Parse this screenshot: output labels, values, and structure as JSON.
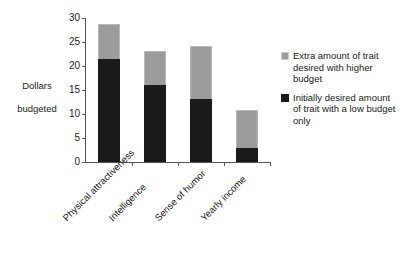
{
  "chart_data": {
    "type": "bar",
    "subtype": "stacked-bar",
    "title": "",
    "xlabel": "",
    "ylabel": "Dollars budgeted",
    "ylim": [
      0,
      30
    ],
    "yticks": [
      0,
      5,
      10,
      15,
      20,
      25,
      30
    ],
    "grid": false,
    "legend_position": "right",
    "categories": [
      "Physical attractiveness",
      "Intelligence",
      "Sense of humor",
      "Yearly income"
    ],
    "series": [
      {
        "name": "Initially desired amount of trait with a low budget only",
        "color": "#1a1a1a",
        "values": [
          21.5,
          16.0,
          13.1,
          2.9
        ]
      },
      {
        "name": "Extra amount of trait desired with higher budget",
        "color": "#9b9b9b",
        "values": [
          7.2,
          7.1,
          11.1,
          7.9
        ]
      }
    ],
    "totals": [
      28.7,
      23.1,
      24.2,
      10.8
    ]
  },
  "axis": {
    "y_title_line1": "Dollars",
    "y_title_line2": "budgeted",
    "y_tick_labels": [
      "30",
      "25",
      "20",
      "15",
      "10",
      "5",
      "0"
    ]
  },
  "legend": {
    "items": [
      {
        "swatch": "gray-swatch",
        "label": "Extra amount of trait desired with higher budget"
      },
      {
        "swatch": "black-swatch",
        "label": "Initially desired amount of trait with a low budget only"
      }
    ]
  }
}
